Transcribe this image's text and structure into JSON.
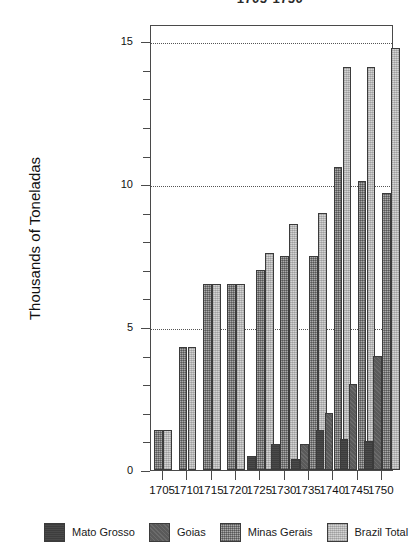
{
  "chart_data": {
    "type": "bar",
    "title": "1705-1750",
    "xlabel": "",
    "ylabel": "Thousands of Toneladas",
    "categories": [
      "1705",
      "1710",
      "1715",
      "1720",
      "1725",
      "1730",
      "1735",
      "1740",
      "1745",
      "1750"
    ],
    "ylim": [
      0,
      15.6
    ],
    "yticks": [
      0,
      5,
      10,
      15
    ],
    "ytick_labels": [
      "0",
      "5",
      "10",
      "15"
    ],
    "yminor_ticks": [
      1,
      2,
      3,
      4,
      6,
      7,
      8,
      9,
      11,
      12,
      13,
      14
    ],
    "grid": "horizontal-dotted",
    "legend_position": "bottom",
    "series": [
      {
        "name": "Mato Grosso",
        "color": "#4a4a4a",
        "values": [
          0,
          0,
          0,
          0,
          0.5,
          0.9,
          0.4,
          1.4,
          1.1,
          1.0
        ]
      },
      {
        "name": "Goias",
        "color": "#5a5a5a",
        "values": [
          0,
          0,
          0,
          0,
          0,
          0,
          0.9,
          2.0,
          3.0,
          4.0
        ]
      },
      {
        "name": "Minas Gerais",
        "color": "#7d7d7d",
        "values": [
          1.4,
          4.3,
          6.5,
          6.5,
          7.0,
          7.5,
          7.5,
          10.6,
          10.1,
          9.7
        ]
      },
      {
        "name": "Brazil Total",
        "color": "#d4d4d4",
        "values": [
          1.4,
          4.3,
          6.5,
          6.5,
          7.6,
          8.6,
          9.0,
          14.1,
          14.1,
          14.75
        ]
      }
    ]
  },
  "legend": {
    "items": [
      {
        "label": "Mato Grosso"
      },
      {
        "label": "Goias"
      },
      {
        "label": "Minas Gerais"
      },
      {
        "label": "Brazil Total"
      }
    ]
  }
}
